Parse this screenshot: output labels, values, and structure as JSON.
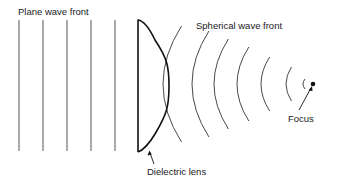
{
  "diagram": {
    "type": "optics-schematic",
    "labels": {
      "plane_wave_front": "Plane wave front",
      "spherical_wave_front": "Spherical wave front",
      "dielectric_lens": "Dielectric lens",
      "focus": "Focus"
    },
    "colors": {
      "line": "#2a2a2a",
      "lens": "#111111",
      "background": "#ffffff"
    },
    "plane_wave_lines_x": [
      19,
      43,
      67,
      91,
      115
    ],
    "plane_wave_y_range": [
      20,
      151
    ],
    "lens": {
      "flat_x": 138,
      "top_y": 20,
      "bottom_y": 152,
      "bulge_x": 169
    },
    "spherical_wavefronts": [
      {
        "x_mid": 163,
        "half_height": 58
      },
      {
        "x_mid": 192,
        "half_height": 53
      },
      {
        "x_mid": 214,
        "half_height": 45
      },
      {
        "x_mid": 237,
        "half_height": 37
      },
      {
        "x_mid": 261,
        "half_height": 27
      },
      {
        "x_mid": 286,
        "half_height": 17
      },
      {
        "x_mid": 303,
        "half_height": 5
      }
    ],
    "focus_point": {
      "x": 313,
      "y": 84
    }
  }
}
